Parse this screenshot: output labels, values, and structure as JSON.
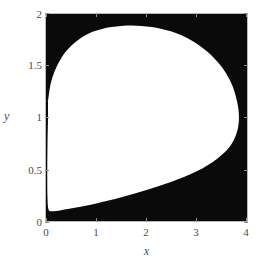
{
  "figure": {
    "kind": "region-plot",
    "background_color": "#ffffff",
    "region_fill_color": "#ffffff",
    "region_background_color": "#0a0a0a",
    "frame_color": "#b9b9b9",
    "text_color": "#4a4a4a"
  },
  "axes": {
    "xlabel": "x",
    "ylabel": "y",
    "xticks": [
      "0",
      "1",
      "2",
      "3",
      "4"
    ],
    "yticks": [
      "0",
      "0.5",
      "1",
      "1.5",
      "2"
    ]
  },
  "chart_data": {
    "type": "area",
    "title": "",
    "xlabel": "x",
    "ylabel": "y",
    "xlim": [
      0,
      4
    ],
    "ylim": [
      0,
      2
    ],
    "xticks": [
      0,
      1,
      2,
      3,
      4
    ],
    "yticks": [
      0,
      0.5,
      1,
      1.5,
      2
    ],
    "grid": false,
    "legend": "none",
    "series": [
      {
        "name": "shaded-region",
        "fill": "#ffffff",
        "description": "Teardrop / egg shaped white region filled inside a black plot background",
        "boundary_points": [
          [
            0.04,
            1.16
          ],
          [
            0.1,
            1.34
          ],
          [
            0.22,
            1.5
          ],
          [
            0.4,
            1.64
          ],
          [
            0.64,
            1.75
          ],
          [
            0.94,
            1.83
          ],
          [
            1.3,
            1.875
          ],
          [
            1.7,
            1.89
          ],
          [
            2.1,
            1.875
          ],
          [
            2.5,
            1.83
          ],
          [
            2.88,
            1.75
          ],
          [
            3.2,
            1.64
          ],
          [
            3.48,
            1.5
          ],
          [
            3.68,
            1.34
          ],
          [
            3.8,
            1.16
          ],
          [
            3.84,
            1.0
          ],
          [
            3.8,
            0.86
          ],
          [
            3.66,
            0.72
          ],
          [
            3.4,
            0.6
          ],
          [
            3.0,
            0.48
          ],
          [
            2.5,
            0.38
          ],
          [
            2.0,
            0.3
          ],
          [
            1.5,
            0.23
          ],
          [
            1.0,
            0.17
          ],
          [
            0.6,
            0.13
          ],
          [
            0.3,
            0.105
          ],
          [
            0.12,
            0.095
          ],
          [
            0.05,
            0.11
          ],
          [
            0.03,
            0.22
          ],
          [
            0.025,
            0.45
          ],
          [
            0.03,
            0.75
          ],
          [
            0.04,
            1.0
          ],
          [
            0.04,
            1.16
          ]
        ]
      }
    ]
  }
}
